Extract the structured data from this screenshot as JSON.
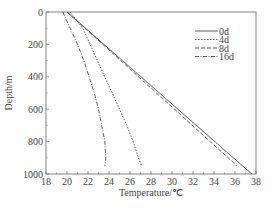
{
  "chart_data": {
    "type": "line",
    "title": "",
    "xlabel": "Temperature/℃",
    "ylabel": "Depth/m",
    "xlim": [
      18,
      38
    ],
    "ylim": [
      0,
      1000
    ],
    "y_inverted": true,
    "x_ticks": [
      18,
      20,
      22,
      24,
      26,
      28,
      30,
      32,
      34,
      36,
      38
    ],
    "y_ticks": [
      0,
      200,
      400,
      600,
      800,
      1000
    ],
    "grid": false,
    "legend_position": "upper right",
    "series": [
      {
        "name": "0d",
        "style": "solid",
        "points": [
          [
            20.0,
            0
          ],
          [
            37.6,
            1000
          ]
        ]
      },
      {
        "name": "4d",
        "style": "dotted",
        "points": [
          [
            20.3,
            0
          ],
          [
            21.5,
            100
          ],
          [
            22.2,
            200
          ],
          [
            22.9,
            300
          ],
          [
            23.6,
            400
          ],
          [
            24.3,
            500
          ],
          [
            25.0,
            600
          ],
          [
            25.7,
            700
          ],
          [
            26.3,
            800
          ],
          [
            26.8,
            900
          ],
          [
            27.1,
            950
          ]
        ]
      },
      {
        "name": "8d",
        "style": "dashed",
        "points": [
          [
            20.0,
            0
          ],
          [
            36.2,
            950
          ]
        ]
      },
      {
        "name": "16d",
        "style": "dash-dot",
        "points": [
          [
            19.6,
            0
          ],
          [
            20.3,
            100
          ],
          [
            21.0,
            200
          ],
          [
            21.6,
            300
          ],
          [
            22.1,
            400
          ],
          [
            22.6,
            500
          ],
          [
            23.0,
            600
          ],
          [
            23.3,
            700
          ],
          [
            23.6,
            800
          ],
          [
            23.7,
            900
          ],
          [
            23.6,
            950
          ]
        ]
      }
    ]
  },
  "legend": {
    "items": [
      {
        "label": "0d",
        "dash": ""
      },
      {
        "label": "4d",
        "dash": "1.5,1.5"
      },
      {
        "label": "8d",
        "dash": "4,2"
      },
      {
        "label": "16d",
        "dash": "4,1.5,1,1.5"
      }
    ]
  },
  "axes": {
    "x_title": "Temperature/℃",
    "y_title": "Depth/m",
    "x_tick_labels": [
      "18",
      "20",
      "22",
      "24",
      "26",
      "28",
      "30",
      "32",
      "34",
      "36",
      "38"
    ],
    "y_tick_labels": [
      "0",
      "200",
      "400",
      "600",
      "800",
      "1000"
    ]
  }
}
